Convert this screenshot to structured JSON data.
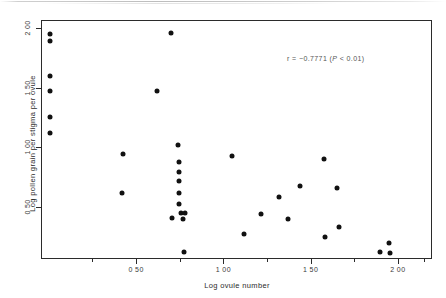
{
  "chart_data": {
    "type": "scatter",
    "title": "",
    "xlabel": "Log ovule number",
    "ylabel": "Log pollen grain per stigma per ovule",
    "xlim": [
      -0.045,
      2.19
    ],
    "ylim": [
      0.07,
      2.07
    ],
    "xticks": [
      0.5,
      1.0,
      1.5,
      2.0
    ],
    "xticklabels": [
      "0 50",
      "1 00",
      "1 50",
      "2 00"
    ],
    "yticks": [
      0.5,
      1.0,
      1.5,
      2.0
    ],
    "yticklabels": [
      "0 50",
      "1 00",
      "1 50",
      "2 00"
    ],
    "xminorticks": [
      0.25,
      0.75,
      1.25,
      1.75,
      2.15
    ],
    "yminorticks": [],
    "grid": false,
    "legend": null,
    "marker": "filled-circle",
    "marker_color": "#111111",
    "annotations": [
      {
        "text": "r = −0.7771 (P < 0.01)",
        "x": 1.4,
        "y": 1.7,
        "parts": {
          "stat": "r = −0.7771 (",
          "p_italic": "P",
          "tail": " < 0.01)"
        }
      }
    ],
    "points": [
      {
        "x": 0.005,
        "y": 1.955
      },
      {
        "x": 0.005,
        "y": 1.89
      },
      {
        "x": 0.005,
        "y": 1.6
      },
      {
        "x": 0.005,
        "y": 1.475
      },
      {
        "x": 0.005,
        "y": 1.255
      },
      {
        "x": 0.005,
        "y": 1.12
      },
      {
        "x": 0.7,
        "y": 1.96
      },
      {
        "x": 0.617,
        "y": 1.47
      },
      {
        "x": 0.425,
        "y": 0.94
      },
      {
        "x": 0.418,
        "y": 0.62
      },
      {
        "x": 0.742,
        "y": 1.02
      },
      {
        "x": 0.748,
        "y": 0.88
      },
      {
        "x": 0.745,
        "y": 0.79
      },
      {
        "x": 0.745,
        "y": 0.715
      },
      {
        "x": 0.745,
        "y": 0.615
      },
      {
        "x": 0.748,
        "y": 0.525
      },
      {
        "x": 0.76,
        "y": 0.45
      },
      {
        "x": 0.782,
        "y": 0.45
      },
      {
        "x": 0.706,
        "y": 0.405
      },
      {
        "x": 0.77,
        "y": 0.4
      },
      {
        "x": 0.775,
        "y": 0.12
      },
      {
        "x": 1.05,
        "y": 0.925
      },
      {
        "x": 1.118,
        "y": 0.27
      },
      {
        "x": 1.218,
        "y": 0.44
      },
      {
        "x": 1.32,
        "y": 0.585
      },
      {
        "x": 1.372,
        "y": 0.395
      },
      {
        "x": 1.438,
        "y": 0.675
      },
      {
        "x": 1.578,
        "y": 0.905
      },
      {
        "x": 1.58,
        "y": 0.25
      },
      {
        "x": 1.652,
        "y": 0.655
      },
      {
        "x": 1.66,
        "y": 0.33
      },
      {
        "x": 1.9,
        "y": 0.12
      },
      {
        "x": 1.948,
        "y": 0.195
      },
      {
        "x": 1.957,
        "y": 0.115
      }
    ]
  }
}
